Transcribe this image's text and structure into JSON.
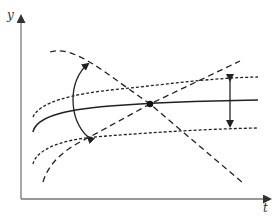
{
  "axes": {
    "y_label": "y",
    "x_label": "t"
  },
  "colors": {
    "line": "#222222",
    "axis": "#555555",
    "background": "#ffffff"
  },
  "elements": [
    {
      "name": "solid-curve",
      "style": "solid"
    },
    {
      "name": "upper-dotted-curve",
      "style": "dotted"
    },
    {
      "name": "lower-dotted-curve",
      "style": "dotted"
    },
    {
      "name": "decreasing-dashed-curve",
      "style": "dashed"
    },
    {
      "name": "increasing-dashed-curve",
      "style": "dashed"
    },
    {
      "name": "curved-double-arrow"
    },
    {
      "name": "vertical-double-arrow"
    },
    {
      "name": "intersection-point"
    }
  ]
}
